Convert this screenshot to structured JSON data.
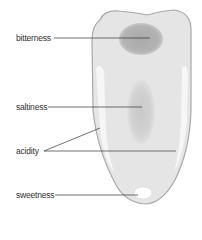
{
  "diagram": {
    "labels": [
      {
        "id": "bitterness",
        "text": "bitterness",
        "x": 16,
        "y": 33
      },
      {
        "id": "saltiness",
        "text": "saltiness",
        "x": 16,
        "y": 102
      },
      {
        "id": "acidity",
        "text": "acidity",
        "x": 16,
        "y": 146
      },
      {
        "id": "sweetness",
        "text": "sweetness",
        "x": 16,
        "y": 190
      }
    ],
    "colors": {
      "tongue_fill": "#e4e4e4",
      "tongue_outline": "#a8a8a8",
      "bitterness_zone": "#b0b0b0",
      "saltiness_zone": "#cfcfcf",
      "acidity_zone": "#f6f6f6",
      "sweetness_zone": "#ffffff",
      "leader_line": "#333333"
    }
  }
}
